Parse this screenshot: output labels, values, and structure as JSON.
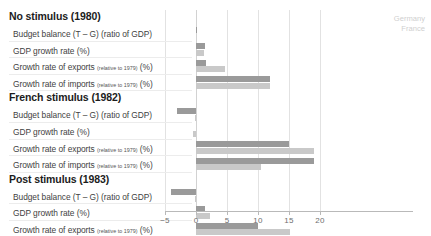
{
  "legend": {
    "entries": [
      "Germany",
      "France"
    ],
    "position": "top-right"
  },
  "colors": {
    "germany": "#9a9a9a",
    "france": "#c9c9c9",
    "grid": "#e2e2e2",
    "axis": "#b9b9b9"
  },
  "axis": {
    "ticks": [
      -5,
      0,
      5,
      10,
      15,
      20
    ],
    "tick_labels": [
      "−5",
      "0",
      "5",
      "10",
      "15",
      "20"
    ],
    "min": -5,
    "max": 20
  },
  "sections": [
    {
      "heading": "No stimulus (1980)",
      "rows": [
        {
          "label": "Budget balance (T – G) (ratio of GDP)",
          "sub": "",
          "germany": 0.1,
          "france": 0.0
        },
        {
          "label": "GDP growth rate (%)",
          "sub": "",
          "germany": 1.5,
          "france": 1.3
        },
        {
          "label": "Growth rate of exports ",
          "sub": "(relative to 1979)",
          "suffix": " (%)",
          "germany": 1.6,
          "france": 4.6
        },
        {
          "label": "Growth rate of imports ",
          "sub": "(relative to 1979)",
          "suffix": " (%)",
          "germany": 12.0,
          "france": 12.0
        }
      ]
    },
    {
      "heading": "French stimulus (1982)",
      "rows": [
        {
          "label": "Budget balance (T – G) (ratio of GDP)",
          "sub": "",
          "germany": -3.0,
          "france": -0.2
        },
        {
          "label": "GDP growth rate (%)",
          "sub": "",
          "germany": 0.0,
          "france": -0.5
        },
        {
          "label": "Growth rate of exports ",
          "sub": "(relative to 1979)",
          "suffix": " (%)",
          "germany": 15.0,
          "france": 19.0
        },
        {
          "label": "Growth rate of imports ",
          "sub": "(relative to 1979)",
          "suffix": " (%)",
          "germany": 19.0,
          "france": 10.5
        }
      ]
    },
    {
      "heading": "Post stimulus (1983)",
      "rows": [
        {
          "label": "Budget balance (T – G) (ratio of GDP)",
          "sub": "",
          "germany": -4.0,
          "france": -0.2
        },
        {
          "label": "GDP growth rate (%)",
          "sub": "",
          "germany": 1.5,
          "france": 2.3
        },
        {
          "label": "Growth rate of exports ",
          "sub": "(relative to 1979)",
          "suffix": " (%)",
          "germany": 10.0,
          "france": 15.2
        },
        {
          "label": "Growth rate of imports ",
          "sub": "(relative to 1979)",
          "suffix": " (%)",
          "germany": 13.3,
          "france": 10.0
        }
      ]
    }
  ],
  "chart_data": {
    "type": "bar",
    "orientation": "horizontal",
    "title": "",
    "xlabel": "",
    "ylabel": "",
    "xlim": [
      -5,
      20
    ],
    "grid": true,
    "legend_position": "top-right",
    "categories": [
      "No stimulus (1980) – Budget balance (T – G) (ratio of GDP)",
      "No stimulus (1980) – GDP growth rate (%)",
      "No stimulus (1980) – Growth rate of exports (relative to 1979) (%)",
      "No stimulus (1980) – Growth rate of imports (relative to 1979) (%)",
      "French stimulus (1982) – Budget balance (T – G) (ratio of GDP)",
      "French stimulus (1982) – GDP growth rate (%)",
      "French stimulus (1982) – Growth rate of exports (relative to 1979) (%)",
      "French stimulus (1982) – Growth rate of imports (relative to 1979) (%)",
      "Post stimulus (1983) – Budget balance (T – G) (ratio of GDP)",
      "Post stimulus (1983) – GDP growth rate (%)",
      "Post stimulus (1983) – Growth rate of exports (relative to 1979) (%)",
      "Post stimulus (1983) – Growth rate of imports (relative to 1979) (%)"
    ],
    "series": [
      {
        "name": "Germany",
        "color": "#9a9a9a",
        "values": [
          0.1,
          1.5,
          1.6,
          12.0,
          -3.0,
          0.0,
          15.0,
          19.0,
          -4.0,
          1.5,
          10.0,
          13.3
        ]
      },
      {
        "name": "France",
        "color": "#c9c9c9",
        "values": [
          0.0,
          1.3,
          4.6,
          12.0,
          -0.2,
          -0.5,
          19.0,
          10.5,
          -0.2,
          2.3,
          15.2,
          10.0
        ]
      }
    ]
  }
}
